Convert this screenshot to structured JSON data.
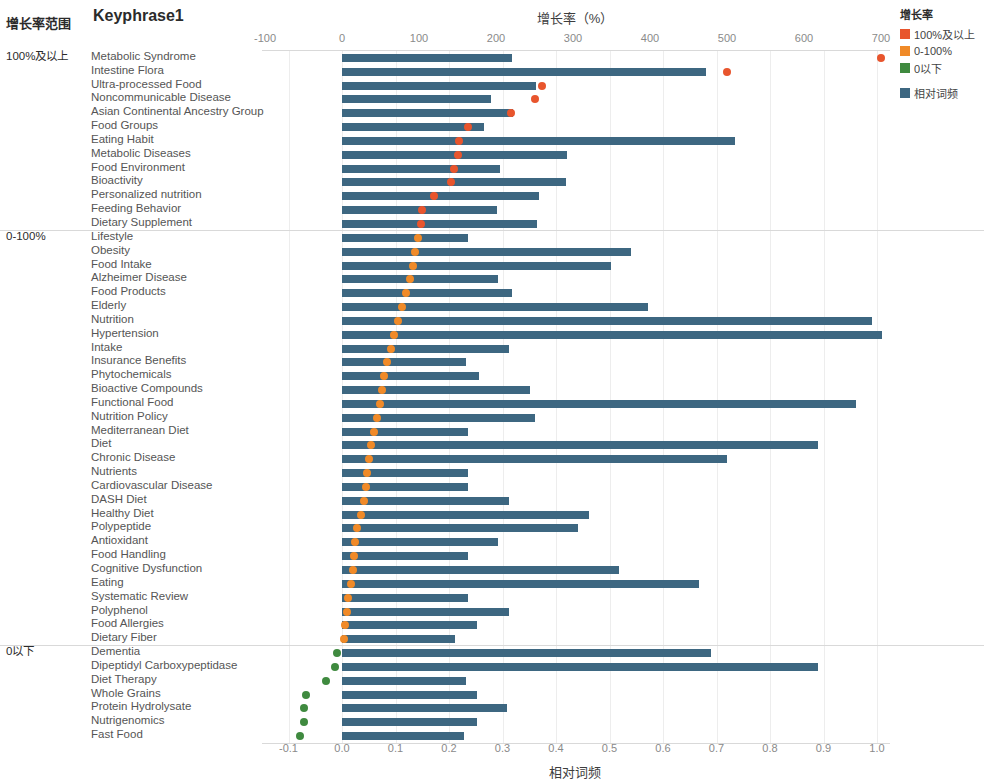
{
  "headers": {
    "range_header": "增长率范围",
    "keyphrase_header": "Keyphrase1"
  },
  "axes": {
    "top_title": "增长率（%）",
    "bottom_title": "相对词频",
    "top_ticks": [
      "-100",
      "0",
      "100",
      "200",
      "300",
      "400",
      "500",
      "600",
      "700"
    ],
    "top_tick_values": [
      -100,
      0,
      100,
      200,
      300,
      400,
      500,
      600,
      700
    ],
    "bottom_ticks": [
      "-0.1",
      "0.0",
      "0.1",
      "0.2",
      "0.3",
      "0.4",
      "0.5",
      "0.6",
      "0.7",
      "0.8",
      "0.9",
      "1.0"
    ],
    "bottom_tick_values": [
      -0.1,
      0.0,
      0.1,
      0.2,
      0.3,
      0.4,
      0.5,
      0.6,
      0.7,
      0.8,
      0.9,
      1.0
    ]
  },
  "legend": {
    "title": "增长率",
    "items": [
      {
        "label": "100%及以上",
        "color": "#e8552d",
        "shape": "square"
      },
      {
        "label": "0-100%",
        "color": "#f08a28",
        "shape": "square"
      },
      {
        "label": "0以下",
        "color": "#3f8a3f",
        "shape": "square"
      },
      {
        "label": "相对词频",
        "color": "#3d6781",
        "shape": "square"
      }
    ]
  },
  "groups": [
    {
      "name": "100%及以上",
      "dot_class": "hi"
    },
    {
      "name": "0-100%",
      "dot_class": "mid"
    },
    {
      "name": "0以下",
      "dot_class": "low"
    }
  ],
  "chart_data": {
    "type": "bar",
    "title": "",
    "xlabel": "相对词频",
    "xlabel_top": "增长率（%）",
    "ylabel": "Keyphrase1",
    "grid": true,
    "legend_position": "right",
    "x_bar_range": [
      -0.1,
      1.0
    ],
    "x_dot_range": [
      -100,
      700
    ],
    "series": [
      {
        "name": "相对词频",
        "type": "bar",
        "color": "#3d6781"
      },
      {
        "name": "增长率",
        "type": "scatter",
        "colors": {
          "100%及以上": "#e8552d",
          "0-100%": "#f08a28",
          "0以下": "#3f8a3f"
        }
      }
    ],
    "rows": [
      {
        "label": "Metabolic Syndrome",
        "group": "100%及以上",
        "freq": 0.318,
        "growth": 700
      },
      {
        "label": "Intestine Flora",
        "group": "100%及以上",
        "freq": 0.68,
        "growth": 500
      },
      {
        "label": "Ultra-processed Food",
        "group": "100%及以上",
        "freq": 0.362,
        "growth": 260
      },
      {
        "label": "Noncommunicable Disease",
        "group": "100%及以上",
        "freq": 0.278,
        "growth": 250
      },
      {
        "label": "Asian Continental Ancestry Group",
        "group": "100%及以上",
        "freq": 0.32,
        "growth": 219
      },
      {
        "label": "Food Groups",
        "group": "100%及以上",
        "freq": 0.265,
        "growth": 163
      },
      {
        "label": "Eating Habit",
        "group": "100%及以上",
        "freq": 0.735,
        "growth": 152
      },
      {
        "label": "Metabolic Diseases",
        "group": "100%及以上",
        "freq": 0.42,
        "growth": 150
      },
      {
        "label": "Food Environment",
        "group": "100%及以上",
        "freq": 0.296,
        "growth": 146
      },
      {
        "label": "Bioactivity",
        "group": "100%及以上",
        "freq": 0.418,
        "growth": 142
      },
      {
        "label": "Personalized nutrition",
        "group": "100%及以上",
        "freq": 0.368,
        "growth": 120
      },
      {
        "label": "Feeding Behavior",
        "group": "100%及以上",
        "freq": 0.29,
        "growth": 104
      },
      {
        "label": "Dietary Supplement",
        "group": "100%及以上",
        "freq": 0.365,
        "growth": 102
      },
      {
        "label": "Lifestyle",
        "group": "0-100%",
        "freq": 0.236,
        "growth": 99
      },
      {
        "label": "Obesity",
        "group": "0-100%",
        "freq": 0.54,
        "growth": 95
      },
      {
        "label": "Food Intake",
        "group": "0-100%",
        "freq": 0.503,
        "growth": 92
      },
      {
        "label": "Alzheimer Disease",
        "group": "0-100%",
        "freq": 0.292,
        "growth": 88
      },
      {
        "label": "Food Products",
        "group": "0-100%",
        "freq": 0.318,
        "growth": 83
      },
      {
        "label": "Elderly",
        "group": "0-100%",
        "freq": 0.572,
        "growth": 78
      },
      {
        "label": "Nutrition",
        "group": "0-100%",
        "freq": 0.99,
        "growth": 73
      },
      {
        "label": "Hypertension",
        "group": "0-100%",
        "freq": 1.01,
        "growth": 68
      },
      {
        "label": "Intake",
        "group": "0-100%",
        "freq": 0.312,
        "growth": 63
      },
      {
        "label": "Insurance Benefits",
        "group": "0-100%",
        "freq": 0.232,
        "growth": 58
      },
      {
        "label": "Phytochemicals",
        "group": "0-100%",
        "freq": 0.256,
        "growth": 55
      },
      {
        "label": "Bioactive Compounds",
        "group": "0-100%",
        "freq": 0.352,
        "growth": 52
      },
      {
        "label": "Functional Food",
        "group": "0-100%",
        "freq": 0.96,
        "growth": 49
      },
      {
        "label": "Nutrition Policy",
        "group": "0-100%",
        "freq": 0.36,
        "growth": 45
      },
      {
        "label": "Mediterranean Diet",
        "group": "0-100%",
        "freq": 0.236,
        "growth": 42
      },
      {
        "label": "Diet",
        "group": "0-100%",
        "freq": 0.89,
        "growth": 38
      },
      {
        "label": "Chronic Disease",
        "group": "0-100%",
        "freq": 0.72,
        "growth": 35
      },
      {
        "label": "Nutrients",
        "group": "0-100%",
        "freq": 0.236,
        "growth": 33
      },
      {
        "label": "Cardiovascular Disease",
        "group": "0-100%",
        "freq": 0.236,
        "growth": 31
      },
      {
        "label": "DASH Diet",
        "group": "0-100%",
        "freq": 0.312,
        "growth": 29
      },
      {
        "label": "Healthy Diet",
        "group": "0-100%",
        "freq": 0.462,
        "growth": 25
      },
      {
        "label": "Polypeptide",
        "group": "0-100%",
        "freq": 0.442,
        "growth": 20
      },
      {
        "label": "Antioxidant",
        "group": "0-100%",
        "freq": 0.292,
        "growth": 17
      },
      {
        "label": "Food Handling",
        "group": "0-100%",
        "freq": 0.236,
        "growth": 16
      },
      {
        "label": "Cognitive Dysfunction",
        "group": "0-100%",
        "freq": 0.518,
        "growth": 14
      },
      {
        "label": "Eating",
        "group": "0-100%",
        "freq": 0.668,
        "growth": 12
      },
      {
        "label": "Systematic Review",
        "group": "0-100%",
        "freq": 0.236,
        "growth": 8
      },
      {
        "label": "Polyphenol",
        "group": "0-100%",
        "freq": 0.312,
        "growth": 6
      },
      {
        "label": "Food Allergies",
        "group": "0-100%",
        "freq": 0.252,
        "growth": 4
      },
      {
        "label": "Dietary Fiber",
        "group": "0-100%",
        "freq": 0.212,
        "growth": 2
      },
      {
        "label": "Dementia",
        "group": "0以下",
        "freq": 0.69,
        "growth": -6
      },
      {
        "label": "Dipeptidyl Carboxypeptidase",
        "group": "0以下",
        "freq": 0.89,
        "growth": -9
      },
      {
        "label": "Diet Therapy",
        "group": "0以下",
        "freq": 0.232,
        "growth": -21
      },
      {
        "label": "Whole Grains",
        "group": "0以下",
        "freq": 0.252,
        "growth": -47
      },
      {
        "label": "Protein Hydrolysate",
        "group": "0以下",
        "freq": 0.308,
        "growth": -49
      },
      {
        "label": "Nutrigenomics",
        "group": "0以下",
        "freq": 0.252,
        "growth": -50
      },
      {
        "label": "Fast Food",
        "group": "0以下",
        "freq": 0.228,
        "growth": -54
      }
    ]
  }
}
